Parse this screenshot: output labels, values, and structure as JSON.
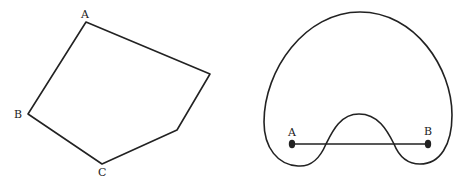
{
  "figures": {
    "polygon": {
      "description": "Convex pentagon-like polygon (non-simple vertex set) with labeled vertices",
      "vertices": [
        {
          "x": 86,
          "y": 22,
          "label": "A"
        },
        {
          "x": 210,
          "y": 74,
          "label": ""
        },
        {
          "x": 177,
          "y": 130,
          "label": ""
        },
        {
          "x": 102,
          "y": 164,
          "label": "C"
        },
        {
          "x": 28,
          "y": 114,
          "label": "B"
        }
      ],
      "labels": {
        "a": "A",
        "b": "B",
        "c": "C"
      }
    },
    "nonconvex_shape": {
      "description": "Non-convex closed curve with segment AB passing outside the region",
      "points": {
        "a_label": "A",
        "b_label": "B"
      },
      "segment": {
        "from": "A",
        "to": "B"
      }
    }
  },
  "colors": {
    "stroke": "#222222",
    "background": "#ffffff"
  }
}
